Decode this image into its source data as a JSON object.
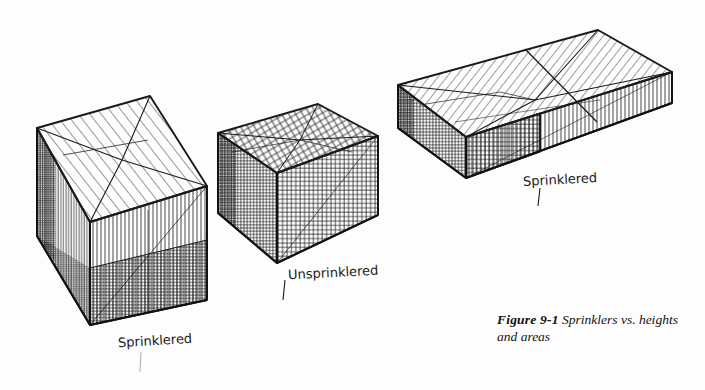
{
  "figure": {
    "background_color": "#fdfdfd",
    "ink_color": "#1a1a1a",
    "caption_label": "Figure 9-1",
    "caption_text": "Sprinklers vs. heights and areas",
    "caption_line1": "Sprinklers vs.",
    "caption_line2": "heights and areas"
  },
  "labels": {
    "box1": "Sprinklered",
    "box2": "Unsprinklered",
    "box3": "Sprinklered"
  },
  "diagram_data": {
    "type": "isometric-volume-comparison",
    "description": "Three hand-drawn hatched isometric boxes comparing building volumes for sprinklered vs. unsprinklered construction",
    "boxes": [
      {
        "id": "box-1",
        "label": "Sprinklered",
        "position": "left",
        "relative_height": "tall",
        "relative_area": "small",
        "top_hatch": "diagonal",
        "side_hatch": "vertical",
        "base_band_hatch": "cross",
        "partition": true
      },
      {
        "id": "box-2",
        "label": "Unsprinklered",
        "position": "center",
        "relative_height": "short",
        "relative_area": "small",
        "top_hatch": "cross",
        "side_hatch": "cross",
        "base_band_hatch": "cross",
        "partition": false
      },
      {
        "id": "box-3",
        "label": "Sprinklered",
        "position": "right",
        "relative_height": "short",
        "relative_area": "large",
        "top_hatch": "diagonal",
        "side_hatch": "vertical",
        "base_band_hatch": "cross",
        "partition": true
      }
    ]
  }
}
